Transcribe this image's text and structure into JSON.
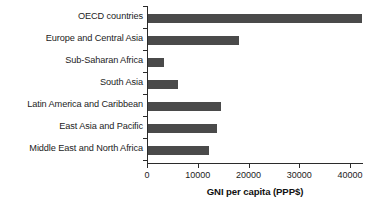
{
  "chart_data": {
    "type": "bar",
    "orientation": "horizontal",
    "title": "",
    "xlabel": "GNI per capita (PPP$)",
    "ylabel": "",
    "categories": [
      "OECD countries",
      "Europe and Central Asia",
      "Sub-Saharan Africa",
      "South Asia",
      "Latin America and Caribbean",
      "East Asia and Pacific",
      "Middle East and North Africa"
    ],
    "values": [
      42200,
      18000,
      3100,
      5900,
      14400,
      13600,
      12000
    ],
    "xlim": [
      0,
      45000
    ],
    "xticks": [
      0,
      10000,
      20000,
      30000,
      40000
    ],
    "xtick_labels": [
      "0",
      "10000",
      "20000",
      "30000",
      "40000"
    ],
    "grid": false,
    "legend": false,
    "bar_color": "#4a4a4a",
    "axis_color": "#2b2b2b",
    "background_color": "#ffffff"
  }
}
